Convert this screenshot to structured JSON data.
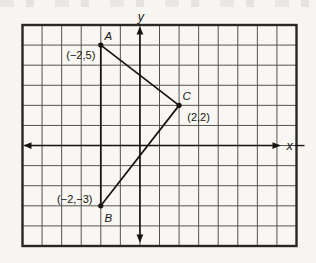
{
  "figure": {
    "kind": "coordinate-plane-triangle",
    "axes": {
      "x_label": "x",
      "y_label": "y"
    },
    "grid": {
      "cols": 14,
      "rows": 11,
      "origin_col": 6,
      "origin_row": 6,
      "x_range": [
        -6,
        8
      ],
      "y_range": [
        -5,
        6
      ]
    },
    "points": [
      {
        "name": "A",
        "x": -2,
        "y": 5,
        "label": "A",
        "coord_label": "(−2,5)"
      },
      {
        "name": "C",
        "x": 2,
        "y": 2,
        "label": "C",
        "coord_label": "(2,2)"
      },
      {
        "name": "B",
        "x": -2,
        "y": -3,
        "label": "B",
        "coord_label": "(−2,−3)"
      }
    ],
    "segments": [
      {
        "from": "A",
        "to": "C"
      },
      {
        "from": "C",
        "to": "B"
      },
      {
        "from": "A",
        "to": "B"
      }
    ],
    "colors": {
      "background": "#f6f5f1",
      "grid_fill": "#f8f7f3",
      "grid_line": "#57544e",
      "border": "#2a2722",
      "ink": "#16140f"
    }
  }
}
